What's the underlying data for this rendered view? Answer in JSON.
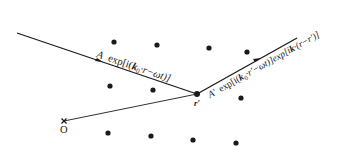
{
  "diagram": {
    "colors": {
      "ink": "#1a1a1a",
      "background": "#ffffff"
    },
    "labels": {
      "incident_wave": "A exp[i(k₀·r−ωt)]",
      "incident_A": "A",
      "incident_exp": "exp[i(",
      "incident_k": "k",
      "incident_k_sub": "0",
      "incident_rest": "·r−ωt)]",
      "scattered_wave": "A′ exp[i(k₀·r′−ωt)]exp[ik·(r−r′)]",
      "scattered_A": "A′",
      "scattered_exp1": "exp[i(",
      "scattered_k0": "k",
      "scattered_k0_sub": "0",
      "scattered_mid": "·r′−ωt)]exp[i",
      "scattered_k": "k",
      "scattered_end": "·(r−r′)]",
      "scatter_point": "r′",
      "origin": "O"
    },
    "scatterer_dots": [
      [
        114,
        42
      ],
      [
        157,
        45
      ],
      [
        209,
        48
      ],
      [
        247,
        52
      ],
      [
        110,
        86
      ],
      [
        153,
        90
      ],
      [
        241,
        98
      ],
      [
        108,
        133
      ],
      [
        151,
        136
      ],
      [
        193,
        140
      ],
      [
        236,
        143
      ]
    ]
  }
}
